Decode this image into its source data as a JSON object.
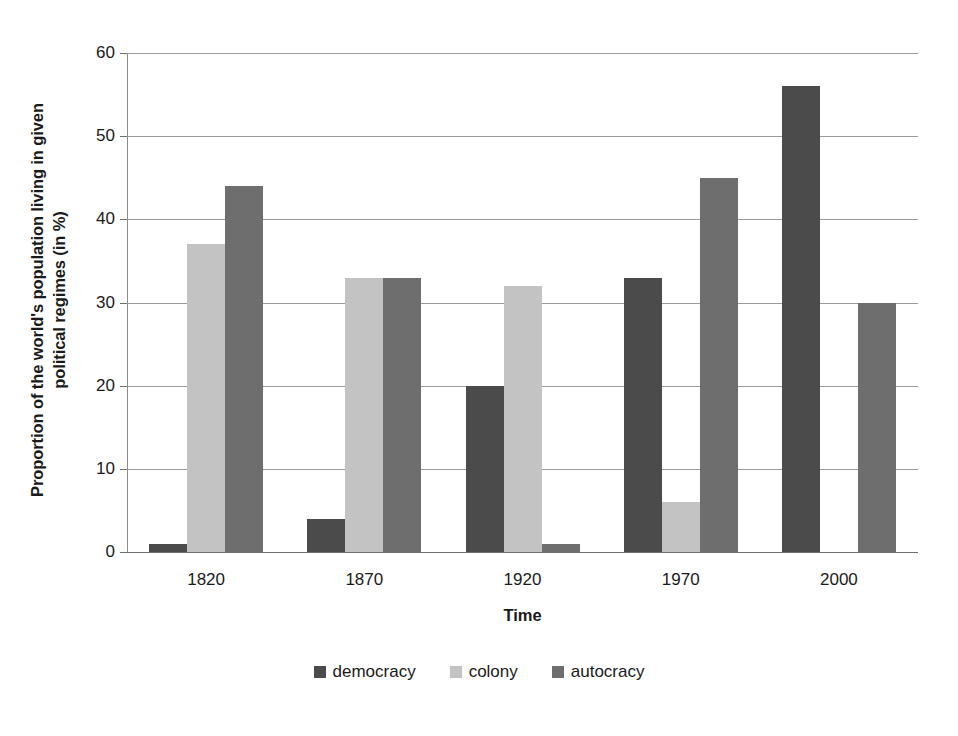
{
  "chart_data": {
    "type": "bar",
    "title": "",
    "xlabel": "Time",
    "ylabel": "Proportion of the world's population living in given political regimes (in %)",
    "ylabel_lines": [
      "Proportion of the world's population living in given",
      "political regimes (in %)"
    ],
    "categories": [
      "1820",
      "1870",
      "1920",
      "1970",
      "2000"
    ],
    "series": [
      {
        "name": "democracy",
        "color": "#4b4b4b",
        "values": [
          1,
          4,
          20,
          33,
          56
        ]
      },
      {
        "name": "colony",
        "color": "#c3c3c3",
        "values": [
          37,
          33,
          32,
          6,
          0
        ]
      },
      {
        "name": "autocracy",
        "color": "#6e6e6e",
        "values": [
          44,
          33,
          1,
          45,
          30
        ]
      }
    ],
    "ylim": [
      0,
      60
    ],
    "ytick_labels": [
      "60",
      "50",
      "40",
      "30",
      "20",
      "10",
      "0"
    ],
    "ytick_values": [
      60,
      50,
      40,
      30,
      20,
      10,
      0
    ],
    "grid": "horizontal",
    "legend_position": "bottom",
    "legend_entries": [
      "democracy",
      "colony",
      "autocracy"
    ]
  }
}
